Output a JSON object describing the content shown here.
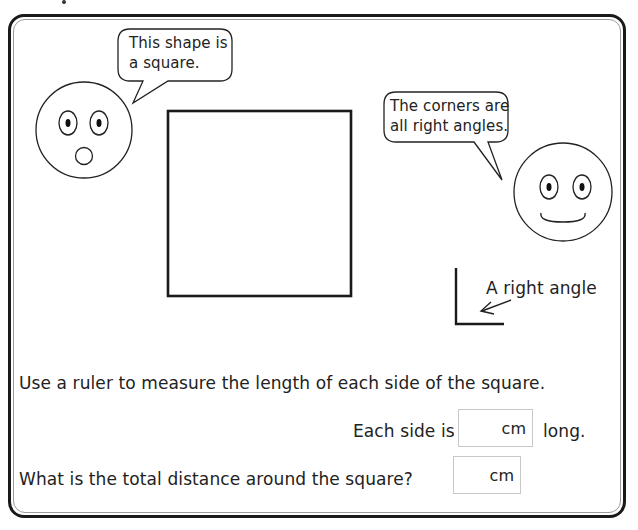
{
  "page": {
    "type": "maths worksheet",
    "topic": "square and right angles"
  },
  "speech_bubbles": [
    {
      "id": "left",
      "lines": [
        "This shape is",
        "a square."
      ]
    },
    {
      "id": "right",
      "lines": [
        "The corners are",
        "all right angles."
      ]
    }
  ],
  "faces": [
    {
      "id": "surprised-face",
      "expression": "surprised"
    },
    {
      "id": "smiling-face",
      "expression": "smiling"
    }
  ],
  "shapes": {
    "square_label": "square",
    "right_angle_label": "A right angle"
  },
  "questions": {
    "instruction": "Use a ruler to measure the length of each side of the square.",
    "q1": {
      "prefix": "Each side is",
      "unit": "cm",
      "suffix": "long.",
      "answer": ""
    },
    "q2": {
      "prompt": "What is the total distance around the square?",
      "unit": "cm",
      "answer": ""
    }
  },
  "colors": {
    "ink": "#1a1a1a",
    "inner_border": "#9a9a9a",
    "answer_box_border": "#c8c8c8"
  }
}
